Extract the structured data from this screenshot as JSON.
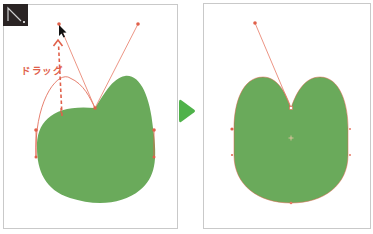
{
  "figure": {
    "colors": {
      "shape_fill": "#6aaa5b",
      "path_stroke": "#e0604a",
      "handle_line": "#e77a66",
      "anchor_point": "#e0604a",
      "arrow": "#4fb24a",
      "panel_border": "#c9c9c9",
      "tool_icon_bg": "#2a2424",
      "cursor": "#111111"
    }
  },
  "left_panel": {
    "tool_icon": "direct-selection-tool-icon",
    "drag_label": "ドラッグ",
    "state": "before"
  },
  "transition_arrow": {
    "icon": "play-arrow-icon",
    "direction": "right"
  },
  "right_panel": {
    "state": "after"
  }
}
